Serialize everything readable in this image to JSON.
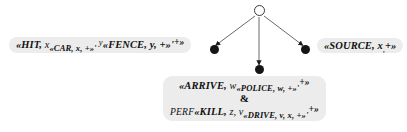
{
  "diagram": {
    "type": "dependency-tree",
    "title": "",
    "root_node": {
      "name": "root-node",
      "shape": "hollow-circle"
    },
    "edges": [
      {
        "from": "root-node",
        "to": "left-node",
        "arrowhead": "filled-triangle"
      },
      {
        "from": "root-node",
        "to": "bottom-node",
        "arrowhead": "filled-triangle"
      },
      {
        "from": "root-node",
        "to": "right-node",
        "arrowhead": "filled-triangle"
      }
    ],
    "colors": {
      "box_background": "#ececec",
      "node_fill": "#151515",
      "root_stroke": "#3a3a3a",
      "edge": "#555555",
      "text": "#111111",
      "page_background": "#ffffff"
    },
    "nodes": {
      "left": {
        "name": "left-node",
        "lines": [
          {
            "parts": [
              {
                "text": "«HIT, ",
                "style": "pred"
              },
              {
                "text": "x",
                "style": "var"
              },
              {
                "text": "«CAR, x, +»'",
                "style": "pred-sub"
              },
              {
                "text": " y",
                "style": "var-sup"
              },
              {
                "text": "«FENCE, y, +»'",
                "style": "pred"
              },
              {
                "text": "+»",
                "style": "plus-sup"
              }
            ],
            "plain": "«HIT, x«CAR, x, +»' y«FENCE, y, +»'+»"
          }
        ]
      },
      "right": {
        "name": "right-node",
        "lines": [
          {
            "parts": [
              {
                "text": "«SOURCE, ",
                "style": "pred"
              },
              {
                "text": "x",
                "style": "pred"
              },
              {
                "text": ",",
                "style": "tail-sub"
              },
              {
                "text": "+»",
                "style": "pred"
              }
            ],
            "plain": "«SOURCE, x,+»"
          }
        ]
      },
      "bottom": {
        "name": "bottom-node",
        "lines": [
          {
            "parts": [
              {
                "text": "«ARRIVE, ",
                "style": "pred"
              },
              {
                "text": "w",
                "style": "var"
              },
              {
                "text": "«POLICE, w, +»'",
                "style": "pred-sub"
              },
              {
                "text": "+»",
                "style": "plus-sup"
              }
            ],
            "plain": "«ARRIVE, w«POLICE, w, +»'+»"
          },
          {
            "parts": [
              {
                "text": "&",
                "style": "amp"
              }
            ],
            "plain": "&"
          },
          {
            "parts": [
              {
                "text": "PERF",
                "style": "prefix"
              },
              {
                "text": "«KILL, ",
                "style": "pred"
              },
              {
                "text": "z, ",
                "style": "var"
              },
              {
                "text": "v",
                "style": "var"
              },
              {
                "text": "«DRIVE, v, x, +»'",
                "style": "pred-sub"
              },
              {
                "text": "+»",
                "style": "plus-sup"
              }
            ],
            "plain": "PERF«KILL, z, v«DRIVE, v, x, +»'+»"
          }
        ]
      }
    }
  }
}
